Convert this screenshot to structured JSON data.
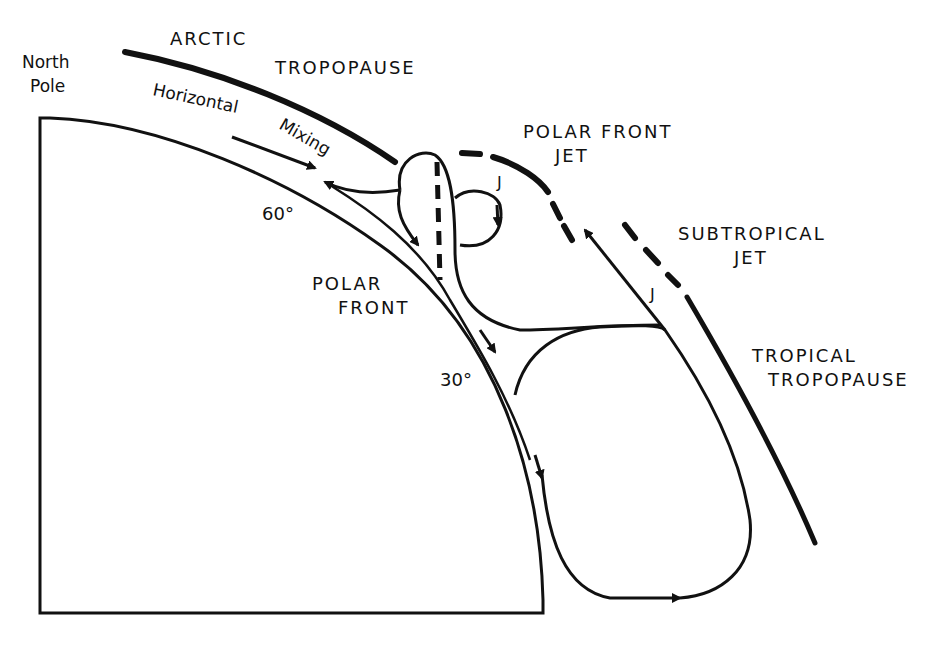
{
  "diagram": {
    "labels": {
      "north_pole_1": "North",
      "north_pole_2": "Pole",
      "arctic": "ARCTIC",
      "arctic_tropopause": "TROPOPAUSE",
      "horizontal": "Horizontal",
      "mixing": "Mixing",
      "polar_front_jet_1": "POLAR FRONT",
      "polar_front_jet_2": "JET",
      "jet_marker_upper": "J",
      "jet_marker_lower": "J",
      "subtropical_jet_1": "SUBTROPICAL",
      "subtropical_jet_2": "JET",
      "lat_60": "60°",
      "lat_30": "30°",
      "polar_front_1": "POLAR",
      "polar_front_2": "FRONT",
      "tropical_1": "TROPICAL",
      "tropical_2": "TROPOPAUSE"
    },
    "colors": {
      "ink": "#111111",
      "background": "#ffffff"
    }
  }
}
